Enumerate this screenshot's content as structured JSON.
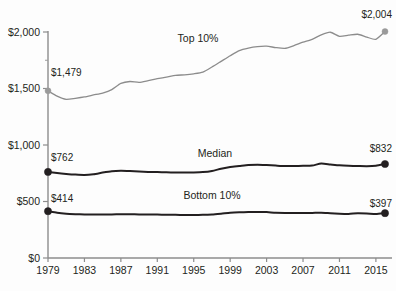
{
  "chart_data": {
    "type": "line",
    "title": "",
    "subtitle": "",
    "xlabel": "",
    "ylabel": "",
    "xlim": [
      1979,
      2016
    ],
    "ylim": [
      0,
      2000
    ],
    "grid": false,
    "legend_position": "inline-labels",
    "x_tick_labels": [
      "1979",
      "1983",
      "1987",
      "1991",
      "1995",
      "1999",
      "2003",
      "2007",
      "2011",
      "2015"
    ],
    "x_tick_values": [
      1979,
      1983,
      1987,
      1991,
      1995,
      1999,
      2003,
      2007,
      2011,
      2015
    ],
    "y_tick_labels": [
      "$0",
      "$500",
      "$1,000",
      "$1,500",
      "$2,000"
    ],
    "y_tick_values": [
      0,
      500,
      1000,
      1500,
      2000
    ],
    "x": [
      1979,
      1980,
      1981,
      1982,
      1983,
      1984,
      1985,
      1986,
      1987,
      1988,
      1989,
      1990,
      1991,
      1992,
      1993,
      1994,
      1995,
      1996,
      1997,
      1998,
      1999,
      2000,
      2001,
      2002,
      2003,
      2004,
      2005,
      2006,
      2007,
      2008,
      2009,
      2010,
      2011,
      2012,
      2013,
      2014,
      2015,
      2016
    ],
    "series": [
      {
        "name": "Top 10%",
        "label": "Top 10%",
        "color": "#8c8c8c",
        "start_value": 1479,
        "start_label": "$1,479",
        "end_value": 2004,
        "end_label": "$2,004",
        "values": [
          1479,
          1432,
          1404,
          1413,
          1425,
          1443,
          1460,
          1490,
          1545,
          1562,
          1554,
          1570,
          1588,
          1600,
          1616,
          1621,
          1630,
          1645,
          1690,
          1740,
          1790,
          1836,
          1858,
          1871,
          1875,
          1862,
          1855,
          1880,
          1910,
          1935,
          1975,
          1998,
          1962,
          1972,
          1980,
          1955,
          1935,
          2004
        ]
      },
      {
        "name": "Median",
        "label": "Median",
        "color": "#231f20",
        "start_value": 762,
        "start_label": "$762",
        "end_value": 832,
        "end_label": "$832",
        "values": [
          762,
          752,
          744,
          738,
          735,
          742,
          756,
          768,
          772,
          770,
          766,
          762,
          760,
          758,
          757,
          756,
          757,
          760,
          770,
          790,
          806,
          814,
          822,
          826,
          823,
          818,
          814,
          814,
          816,
          818,
          836,
          828,
          820,
          816,
          814,
          812,
          816,
          832
        ]
      },
      {
        "name": "Bottom 10%",
        "label": "Bottom 10%",
        "color": "#231f20",
        "start_value": 414,
        "start_label": "$414",
        "end_value": 397,
        "end_label": "$397",
        "values": [
          414,
          400,
          392,
          388,
          386,
          386,
          386,
          386,
          387,
          387,
          386,
          385,
          384,
          383,
          382,
          381,
          381,
          382,
          385,
          392,
          400,
          404,
          406,
          408,
          406,
          400,
          398,
          398,
          399,
          399,
          400,
          396,
          392,
          390,
          396,
          394,
          389,
          397
        ]
      }
    ]
  }
}
